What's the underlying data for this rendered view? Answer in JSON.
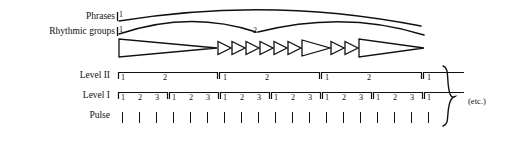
{
  "figure": {
    "background_color": "#ffffff",
    "ink_color": "#111111"
  },
  "row_labels": {
    "phrases": "Phrases",
    "rhythmic_groups": "Rhythmic groups",
    "level_two": "Level II",
    "level_one": "Level I",
    "pulse": "Pulse"
  },
  "annotations": {
    "etc": "(etc.)",
    "phrase_start_marker": "1",
    "group_start_marker": "1",
    "group_mid_marker": "2"
  },
  "phrases": {
    "arcs": [
      {
        "name": "phrase-arc-1",
        "start_x": 119,
        "end_x": 421,
        "apex_y": 6
      }
    ],
    "start_label": "1"
  },
  "rhythmic_groups": {
    "arcs": [
      {
        "name": "group-arc-1",
        "start_x": 119,
        "end_x": 256,
        "apex_y": 18
      },
      {
        "name": "group-arc-2",
        "start_x": 256,
        "end_x": 424,
        "apex_y": 18
      }
    ],
    "start_label": "1",
    "mid_label": "2",
    "triangles": [
      {
        "name": "triangle-1",
        "x1": 119,
        "x2": 217,
        "size": "long"
      },
      {
        "name": "triangle-2",
        "x1": 218,
        "x2": 231,
        "size": "short"
      },
      {
        "name": "triangle-3",
        "x1": 232,
        "x2": 245,
        "size": "short"
      },
      {
        "name": "triangle-4",
        "x1": 246,
        "x2": 259,
        "size": "short"
      },
      {
        "name": "triangle-5",
        "x1": 260,
        "x2": 273,
        "size": "short"
      },
      {
        "name": "triangle-6",
        "x1": 274,
        "x2": 287,
        "size": "short"
      },
      {
        "name": "triangle-7",
        "x1": 288,
        "x2": 301,
        "size": "short"
      },
      {
        "name": "triangle-8",
        "x1": 302,
        "x2": 330,
        "size": "medium"
      },
      {
        "name": "triangle-9",
        "x1": 331,
        "x2": 344,
        "size": "short"
      },
      {
        "name": "triangle-10",
        "x1": 345,
        "x2": 358,
        "size": "short"
      },
      {
        "name": "triangle-11",
        "x1": 359,
        "x2": 424,
        "size": "long"
      }
    ]
  },
  "chart_data": {
    "type": "table",
    "levels": [
      {
        "name": "Level II",
        "groups": [
          {
            "labels": [
              "1",
              "2"
            ],
            "complete": true,
            "start_x": 119,
            "end_x": 169
          },
          {
            "labels": [
              "1",
              "2"
            ],
            "complete": true,
            "start_x": 170,
            "end_x": 220
          },
          {
            "labels": [
              "1",
              "2"
            ],
            "complete": true,
            "start_x": 221,
            "end_x": 271
          },
          {
            "labels": [
              "1"
            ],
            "complete": false,
            "start_x": 272,
            "end_x": 296
          }
        ]
      },
      {
        "name": "Level I",
        "groups": [
          {
            "labels": [
              "1",
              "2",
              "3"
            ],
            "complete": true
          },
          {
            "labels": [
              "1",
              "2",
              "3"
            ],
            "complete": true
          },
          {
            "labels": [
              "1",
              "2",
              "3"
            ],
            "complete": true
          },
          {
            "labels": [
              "1",
              "2",
              "3"
            ],
            "complete": true
          },
          {
            "labels": [
              "1",
              "2",
              "3"
            ],
            "complete": true
          },
          {
            "labels": [
              "1",
              "2",
              "3"
            ],
            "complete": true
          },
          {
            "labels": [
              "1"
            ],
            "complete": false
          }
        ]
      },
      {
        "name": "Pulse",
        "count": 19
      }
    ]
  },
  "level_two": {
    "brackets": [
      {
        "name": "level2-bracket-1",
        "x_start": 118,
        "x_end": 218,
        "labels": [
          {
            "text": "1",
            "x": 121
          },
          {
            "text": "2",
            "x": 163
          }
        ],
        "closed": true
      },
      {
        "name": "level2-bracket-2",
        "x_start": 220,
        "x_end": 320,
        "labels": [
          {
            "text": "1",
            "x": 223
          },
          {
            "text": "2",
            "x": 265
          }
        ],
        "closed": true
      },
      {
        "name": "level2-bracket-3",
        "x_start": 322,
        "x_end": 422,
        "labels": [
          {
            "text": "1",
            "x": 325
          },
          {
            "text": "2",
            "x": 367
          }
        ],
        "closed": true
      },
      {
        "name": "level2-bracket-4",
        "x_start": 424,
        "x_end": 464,
        "labels": [
          {
            "text": "1",
            "x": 427
          }
        ],
        "closed": false
      }
    ]
  },
  "level_one": {
    "brackets": [
      {
        "name": "level1-bracket-1",
        "x_start": 118,
        "x_end": 168,
        "labels": [
          {
            "text": "1",
            "x": 121
          },
          {
            "text": "2",
            "x": 138
          },
          {
            "text": "3",
            "x": 155
          }
        ],
        "closed": true
      },
      {
        "name": "level1-bracket-2",
        "x_start": 169,
        "x_end": 219,
        "labels": [
          {
            "text": "1",
            "x": 172
          },
          {
            "text": "2",
            "x": 189
          },
          {
            "text": "3",
            "x": 206
          }
        ],
        "closed": true
      },
      {
        "name": "level1-bracket-3",
        "x_start": 220,
        "x_end": 270,
        "labels": [
          {
            "text": "1",
            "x": 223
          },
          {
            "text": "2",
            "x": 240
          },
          {
            "text": "3",
            "x": 257
          }
        ],
        "closed": true
      },
      {
        "name": "level1-bracket-4",
        "x_start": 271,
        "x_end": 321,
        "labels": [
          {
            "text": "1",
            "x": 274
          },
          {
            "text": "2",
            "x": 291
          },
          {
            "text": "3",
            "x": 308
          }
        ],
        "closed": true
      },
      {
        "name": "level1-bracket-5",
        "x_start": 322,
        "x_end": 372,
        "labels": [
          {
            "text": "1",
            "x": 325
          },
          {
            "text": "2",
            "x": 342
          },
          {
            "text": "3",
            "x": 359
          }
        ],
        "closed": true
      },
      {
        "name": "level1-bracket-6",
        "x_start": 373,
        "x_end": 423,
        "labels": [
          {
            "text": "1",
            "x": 376
          },
          {
            "text": "2",
            "x": 393
          },
          {
            "text": "3",
            "x": 410
          }
        ],
        "closed": true
      },
      {
        "name": "level1-bracket-7",
        "x_start": 424,
        "x_end": 464,
        "labels": [
          {
            "text": "1",
            "x": 427
          }
        ],
        "closed": false
      }
    ]
  },
  "pulse": {
    "x_positions": [
      121,
      138,
      155,
      172,
      189,
      206,
      223,
      240,
      257,
      274,
      291,
      308,
      325,
      342,
      359,
      376,
      393,
      410,
      427
    ],
    "y": 112,
    "height": 11
  },
  "brace": {
    "name": "right-curly-brace",
    "x": 444,
    "y_top": 66,
    "y_bottom": 126
  }
}
